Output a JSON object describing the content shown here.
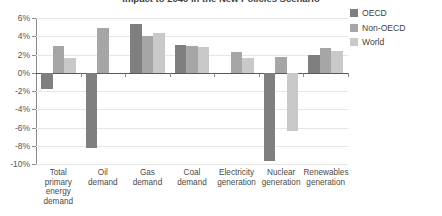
{
  "chart_data": {
    "type": "bar",
    "title": "Impact to 2040 in the New Policies Scenario",
    "xlabel": "",
    "ylabel": "",
    "ylim": [
      -10,
      6
    ],
    "ytick_step": 2,
    "ytick_labels": [
      "6%",
      "4%",
      "2%",
      "0%",
      "-2%",
      "-4%",
      "-6%",
      "-8%",
      "-10%"
    ],
    "ytick_values": [
      6,
      4,
      2,
      0,
      -2,
      -4,
      -6,
      -8,
      -10
    ],
    "grid": true,
    "legend_position": "right",
    "categories": [
      "Total primary energy demand",
      "Oil demand",
      "Gas demand",
      "Coal demand",
      "Electricity generation",
      "Nuclear generation",
      "Renewables generation"
    ],
    "category_lines": [
      [
        "Total",
        "primary",
        "energy",
        "demand"
      ],
      [
        "Oil",
        "demand"
      ],
      [
        "Gas",
        "demand"
      ],
      [
        "Coal",
        "demand"
      ],
      [
        "Electricity",
        "generation"
      ],
      [
        "Nuclear",
        "generation"
      ],
      [
        "Renewables",
        "generation"
      ]
    ],
    "series": [
      {
        "name": "OECD",
        "color": "#7f7f7f",
        "values": [
          -1.8,
          -8.2,
          5.3,
          3.0,
          0.0,
          -9.7,
          2.0
        ]
      },
      {
        "name": "Non-OECD",
        "color": "#a6a6a6",
        "values": [
          2.9,
          4.9,
          4.0,
          2.9,
          2.3,
          1.7,
          2.7
        ]
      },
      {
        "name": "World",
        "color": "#c9c9c9",
        "values": [
          1.6,
          0.0,
          4.4,
          2.8,
          1.6,
          -6.4,
          2.4
        ]
      }
    ]
  },
  "legend": {
    "items": [
      {
        "label": "OECD",
        "color": "#7f7f7f"
      },
      {
        "label": "Non-OECD",
        "color": "#a6a6a6"
      },
      {
        "label": "World",
        "color": "#c9c9c9"
      }
    ]
  }
}
